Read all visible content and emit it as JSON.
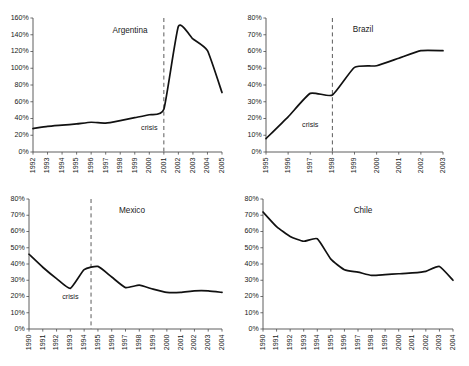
{
  "figure": {
    "background_color": "#ffffff",
    "line_color": "#111111",
    "axis_color": "#4d4d4d",
    "crisis_line_color": "#5a5a5a"
  },
  "chart_data": [
    {
      "type": "line",
      "title": "Argentina",
      "xlabel": "",
      "ylabel": "",
      "grid": false,
      "legend": null,
      "ylim": [
        0,
        160
      ],
      "ytick_labels": [
        "0%",
        "20%",
        "40%",
        "60%",
        "80%",
        "100%",
        "120%",
        "140%",
        "160%"
      ],
      "ytick_values": [
        0,
        20,
        40,
        60,
        80,
        100,
        120,
        140,
        160
      ],
      "categories": [
        "1992",
        "1993",
        "1994",
        "1995",
        "1996",
        "1997",
        "1998",
        "1999",
        "2000",
        "2001",
        "2002",
        "2003",
        "2004",
        "2005"
      ],
      "values": [
        28,
        30.5,
        32,
        33.5,
        35.5,
        34.5,
        37.5,
        41,
        44.5,
        51,
        150,
        135,
        121,
        71
      ],
      "annotations": [
        {
          "text": "crisis",
          "at_category": "2000",
          "value": 26
        }
      ],
      "crisis_marker": {
        "label": "crisis",
        "at_category": "2001"
      }
    },
    {
      "type": "line",
      "title": "Brazil",
      "xlabel": "",
      "ylabel": "",
      "grid": false,
      "legend": null,
      "ylim": [
        0,
        80
      ],
      "ytick_labels": [
        "0%",
        "10%",
        "20%",
        "30%",
        "40%",
        "50%",
        "60%",
        "70%",
        "80%"
      ],
      "ytick_values": [
        0,
        10,
        20,
        30,
        40,
        50,
        60,
        70,
        80
      ],
      "categories": [
        "1995",
        "1996",
        "1997",
        "1998",
        "1999",
        "2000",
        "2001",
        "2002",
        "2003"
      ],
      "values": [
        8,
        21,
        35,
        34,
        50.5,
        51.5,
        56,
        60.5,
        60.5
      ],
      "annotations": [
        {
          "text": "crisis",
          "at_category": "1997",
          "value": 15
        }
      ],
      "crisis_marker": {
        "label": "crisis",
        "at_category": "1998"
      }
    },
    {
      "type": "line",
      "title": "Mexico",
      "xlabel": "",
      "ylabel": "",
      "grid": false,
      "legend": null,
      "ylim": [
        0,
        80
      ],
      "ytick_labels": [
        "0%",
        "10%",
        "20%",
        "30%",
        "40%",
        "50%",
        "60%",
        "70%",
        "80%"
      ],
      "ytick_values": [
        0,
        10,
        20,
        30,
        40,
        50,
        60,
        70,
        80
      ],
      "categories": [
        "1990",
        "1991",
        "1992",
        "1993",
        "1994",
        "1995",
        "1996",
        "1997",
        "1998",
        "1999",
        "2000",
        "2001",
        "2002",
        "2003",
        "2004"
      ],
      "values": [
        46,
        38,
        31,
        25,
        36.5,
        38.5,
        32,
        25.5,
        27,
        24.5,
        22.5,
        22.5,
        23.5,
        23.5,
        22.5
      ],
      "annotations": [
        {
          "text": "crisis",
          "at_category": "1993",
          "value": 18.5
        }
      ],
      "crisis_marker": {
        "label": "crisis",
        "at_category": "1994.5"
      }
    },
    {
      "type": "line",
      "title": "Chile",
      "xlabel": "",
      "ylabel": "",
      "grid": false,
      "legend": null,
      "ylim": [
        0,
        80
      ],
      "ytick_labels": [
        "0%",
        "10%",
        "20%",
        "30%",
        "40%",
        "50%",
        "60%",
        "70%",
        "80%"
      ],
      "ytick_values": [
        0,
        10,
        20,
        30,
        40,
        50,
        60,
        70,
        80
      ],
      "categories": [
        "1990",
        "1991",
        "1992",
        "1993",
        "1994",
        "1995",
        "1996",
        "1997",
        "1998",
        "1999",
        "2000",
        "2001",
        "2002",
        "2003",
        "2004"
      ],
      "values": [
        72,
        63,
        57,
        54,
        55.5,
        43,
        36.5,
        35,
        33,
        33.5,
        34,
        34.5,
        35.5,
        38.5,
        30
      ],
      "annotations": [],
      "crisis_marker": null
    }
  ]
}
